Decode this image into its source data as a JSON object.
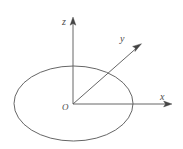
{
  "figure": {
    "name": "3d-coordinate-axes-with-ellipse",
    "background_color": "#ffffff",
    "stroke_color": "#555555",
    "label_color": "#4a4a4a",
    "labels": {
      "z_axis": "z",
      "y_axis": "y",
      "x_axis": "x",
      "origin": "O"
    },
    "geometry": {
      "origin": {
        "x": 73,
        "y": 104
      },
      "ellipse": {
        "cx": 73.5,
        "cy": 103.5,
        "rx": 59.5,
        "ry": 37.5
      },
      "z_axis": {
        "x1": 73,
        "y1": 104,
        "x2": 73,
        "y2": 20
      },
      "y_axis": {
        "x1": 73,
        "y1": 104,
        "x2": 140,
        "y2": 45
      },
      "x_axis": {
        "x1": 73,
        "y1": 104,
        "x2": 171,
        "y2": 104
      }
    }
  }
}
